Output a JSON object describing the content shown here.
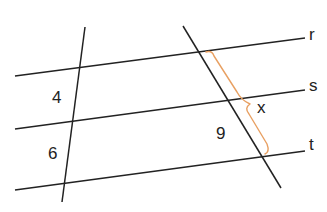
{
  "diagram": {
    "type": "parallel-lines-proportional-segments",
    "colors": {
      "line": "#222222",
      "brace": "#e8a062",
      "text": "#222222",
      "background": "#ffffff"
    },
    "parallel_lines": [
      {
        "name": "r",
        "label": "r",
        "x1": 15,
        "y1": 76,
        "x2": 305,
        "y2": 38,
        "label_x": 309,
        "label_y": 40
      },
      {
        "name": "s",
        "label": "s",
        "x1": 15,
        "y1": 129,
        "x2": 305,
        "y2": 90,
        "label_x": 309,
        "label_y": 91
      },
      {
        "name": "t",
        "label": "t",
        "x1": 15,
        "y1": 190,
        "x2": 305,
        "y2": 151,
        "label_x": 309,
        "label_y": 150
      }
    ],
    "transversals": [
      {
        "name": "left-transversal",
        "x1": 85,
        "y1": 27,
        "x2": 62,
        "y2": 202
      },
      {
        "name": "right-transversal",
        "x1": 183,
        "y1": 26,
        "x2": 281,
        "y2": 188
      }
    ],
    "segment_labels": [
      {
        "name": "left-upper-segment",
        "text": "4",
        "x": 52,
        "y": 103
      },
      {
        "name": "left-lower-segment",
        "text": "6",
        "x": 48,
        "y": 159
      },
      {
        "name": "right-lower-segment",
        "text": "9",
        "x": 216,
        "y": 139
      },
      {
        "name": "brace-segment",
        "text": "x",
        "x": 257,
        "y": 113
      }
    ],
    "brace": {
      "from": "r",
      "to": "t",
      "label": "x"
    }
  }
}
